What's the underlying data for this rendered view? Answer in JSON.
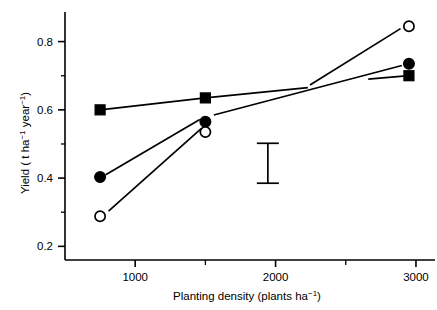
{
  "chart_data": {
    "type": "scatter",
    "title": "",
    "xlabel": "Planting density (plants ha⁻¹)",
    "ylabel": "Yield ( t ha⁻¹ year⁻¹)",
    "xlim": [
      500,
      3100
    ],
    "ylim": [
      0.16,
      0.875
    ],
    "grid": false,
    "legend": "none",
    "x_ticks": [
      1000,
      2000,
      3000
    ],
    "x_tick_labels": [
      "1000",
      "2000",
      "3000"
    ],
    "x_minor_ticks": [
      1500,
      2500
    ],
    "y_ticks": [
      0.2,
      0.4,
      0.6,
      0.8
    ],
    "y_tick_labels": [
      "0.2",
      "0.4",
      "0.6",
      "0.8"
    ],
    "y_minor_ticks": [
      0.3,
      0.5,
      0.7
    ],
    "x": [
      750,
      1500,
      2950
    ],
    "series": [
      {
        "name": "filled-square",
        "marker": "filled-square",
        "values": [
          0.6,
          0.635,
          0.7
        ],
        "line_segments": [
          [
            [
              750,
              0.6
            ],
            [
              1500,
              0.635
            ],
            [
              2230,
              0.665
            ]
          ],
          [
            [
              2660,
              0.69
            ],
            [
              2950,
              0.7
            ]
          ]
        ]
      },
      {
        "name": "filled-circle",
        "marker": "filled-circle",
        "values": [
          0.403,
          0.565,
          0.735
        ],
        "line_segments": [
          [
            [
              790,
              0.41
            ],
            [
              1460,
              0.572
            ]
          ],
          [
            [
              1560,
              0.585
            ],
            [
              2900,
              0.73
            ]
          ]
        ]
      },
      {
        "name": "open-circle",
        "marker": "open-circle",
        "values": [
          0.288,
          0.535,
          0.845
        ],
        "line_segments": [
          [
            [
              810,
              0.303
            ],
            [
              1470,
              0.545
            ]
          ],
          [
            [
              2245,
              0.673
            ],
            [
              2890,
              0.838
            ]
          ]
        ]
      }
    ],
    "error_bar": {
      "label": "LSD bar",
      "x": 1945,
      "y_low": 0.385,
      "y_high": 0.502,
      "cap_width": 22
    }
  },
  "figure": {
    "background_color": "#ffffff",
    "line_color": "#000000"
  }
}
